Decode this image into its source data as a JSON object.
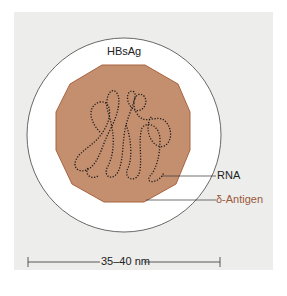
{
  "labels": {
    "envelope": "HBsAg",
    "rna": "RNA",
    "antigen": "δ-Antigen",
    "scale": "35–40 nm"
  },
  "colors": {
    "panel_bg": "#ededeb",
    "envelope_fill": "#ffffff",
    "core_fill": "#c48f6f",
    "core_stroke": "#a8643f",
    "rna_stroke": "#1a1a1a",
    "antigen_label": "#9a5a3c"
  }
}
